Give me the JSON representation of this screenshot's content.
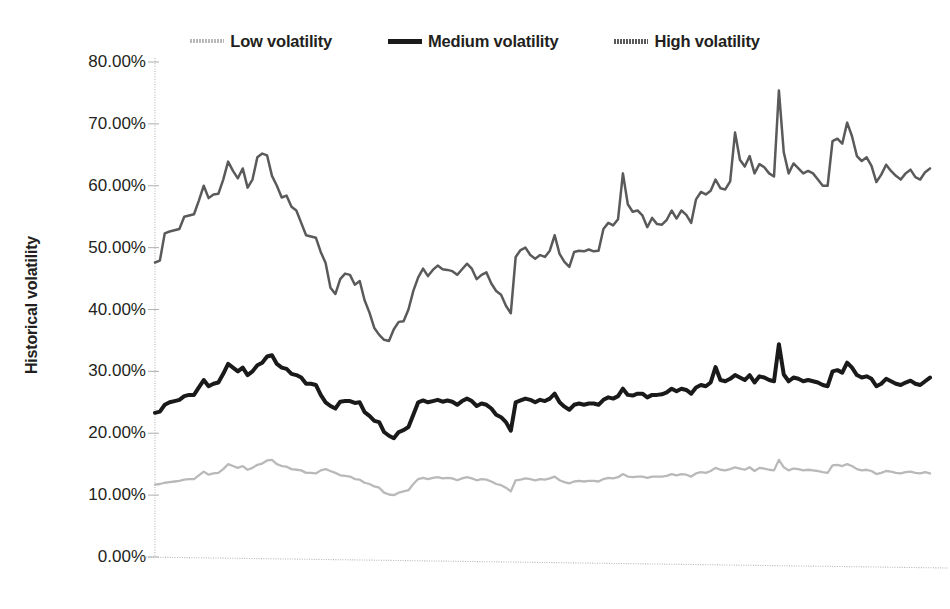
{
  "legend": {
    "position": "top-center",
    "entries": [
      {
        "label": "Low volatility",
        "icon": "line-swatch-dotted-light",
        "color": "#b9b9b9"
      },
      {
        "label": "Medium volatility",
        "icon": "line-swatch-solid-black",
        "color": "#1a1a1a"
      },
      {
        "label": "High volatility",
        "icon": "line-swatch-dotted-dark",
        "color": "#5a5a5a"
      }
    ]
  },
  "axes": {
    "y_title": "Historical volatility",
    "y_ticks": [
      "0.00%",
      "10.00%",
      "20.00%",
      "30.00%",
      "40.00%",
      "50.00%",
      "60.00%",
      "70.00%",
      "80.00%"
    ],
    "x_ticks": []
  },
  "colors": {
    "low": "#b9b9b9",
    "medium": "#1a1a1a",
    "high": "#5a5a5a",
    "axis": "#b5b5b5",
    "text": "#231f20",
    "background": "#ffffff"
  },
  "chart_data": {
    "type": "line",
    "title": "",
    "subtitle": "",
    "xlabel": "",
    "ylabel": "Historical volatility",
    "ylim": [
      0,
      80
    ],
    "ytick_step": 10,
    "y_unit": "percent",
    "grid": false,
    "x_axis_labels_shown": false,
    "legend_position": "top-center",
    "n_points": 160,
    "series": [
      {
        "name": "High volatility",
        "color": "#5a5a5a",
        "values": [
          47.6,
          47.9,
          52.3,
          52.6,
          52.8,
          53.0,
          55.0,
          55.2,
          55.4,
          57.6,
          60.0,
          58.0,
          58.6,
          58.7,
          61.0,
          63.9,
          62.4,
          61.2,
          62.8,
          59.7,
          61.0,
          64.6,
          65.2,
          64.9,
          61.6,
          60.0,
          58.1,
          58.4,
          56.6,
          56.0,
          54.0,
          52.0,
          51.8,
          51.6,
          49.3,
          47.5,
          43.5,
          42.5,
          44.9,
          45.8,
          45.6,
          44.0,
          44.6,
          41.5,
          39.5,
          37.0,
          35.9,
          35.1,
          34.9,
          36.8,
          38.0,
          38.1,
          40.0,
          43.0,
          45.2,
          46.6,
          45.4,
          46.4,
          47.1,
          46.5,
          46.4,
          46.2,
          45.6,
          46.5,
          47.4,
          46.6,
          44.9,
          45.6,
          46.0,
          44.2,
          43.0,
          42.4,
          40.6,
          39.4,
          48.5,
          49.6,
          50.0,
          48.8,
          48.2,
          48.8,
          48.5,
          49.5,
          52.0,
          49.0,
          47.7,
          46.9,
          49.3,
          49.5,
          49.4,
          49.7,
          49.4,
          49.5,
          53.0,
          54.0,
          53.6,
          54.6,
          62.0,
          57.0,
          55.8,
          56.0,
          55.2,
          53.3,
          54.8,
          53.8,
          53.7,
          54.5,
          56.0,
          54.7,
          56.0,
          55.3,
          54.0,
          57.8,
          59.0,
          58.6,
          59.2,
          61.0,
          59.6,
          59.4,
          60.7,
          68.6,
          64.2,
          63.1,
          64.8,
          62.0,
          63.5,
          63.0,
          62.0,
          61.5,
          75.4,
          65.4,
          62.0,
          63.6,
          62.8,
          62.0,
          62.4,
          62.0,
          61.0,
          60.0,
          60.0,
          67.2,
          67.6,
          66.8,
          70.2,
          68.0,
          64.8,
          64.0,
          64.6,
          63.2,
          60.6,
          61.8,
          63.4,
          62.4,
          61.6,
          61.0,
          62.0,
          62.6,
          61.4,
          61.0,
          62.2,
          62.8
        ]
      },
      {
        "name": "Medium volatility",
        "color": "#1a1a1a",
        "values": [
          23.3,
          23.5,
          24.6,
          25.0,
          25.2,
          25.4,
          26.0,
          26.2,
          26.2,
          27.4,
          28.6,
          27.6,
          28.0,
          28.2,
          29.6,
          31.2,
          30.6,
          30.0,
          30.6,
          29.4,
          30.0,
          31.0,
          31.4,
          32.4,
          32.6,
          31.2,
          30.6,
          30.4,
          29.6,
          29.4,
          29.0,
          28.0,
          28.0,
          27.8,
          26.2,
          25.0,
          24.4,
          24.0,
          25.1,
          25.2,
          25.2,
          24.9,
          25.0,
          23.4,
          22.8,
          22.0,
          21.8,
          20.2,
          19.6,
          19.2,
          20.2,
          20.5,
          21.0,
          23.0,
          25.0,
          25.3,
          25.0,
          25.2,
          25.4,
          25.1,
          25.3,
          25.1,
          24.6,
          25.2,
          25.6,
          25.2,
          24.4,
          24.8,
          24.6,
          24.0,
          23.0,
          22.6,
          21.8,
          20.4,
          25.0,
          25.3,
          25.6,
          25.4,
          25.0,
          25.4,
          25.2,
          25.6,
          26.4,
          25.0,
          24.3,
          23.8,
          24.6,
          24.8,
          24.6,
          24.8,
          24.8,
          24.6,
          25.4,
          25.8,
          25.6,
          26.0,
          27.2,
          26.2,
          26.1,
          26.4,
          26.4,
          25.8,
          26.2,
          26.2,
          26.3,
          26.6,
          27.2,
          26.8,
          27.2,
          27.0,
          26.4,
          27.4,
          27.8,
          27.6,
          28.2,
          30.7,
          28.6,
          28.4,
          28.8,
          29.4,
          29.0,
          28.6,
          29.4,
          28.2,
          29.2,
          29.0,
          28.6,
          28.4,
          34.4,
          29.5,
          28.4,
          29.0,
          28.8,
          28.4,
          28.6,
          28.4,
          28.2,
          27.8,
          27.6,
          30.0,
          30.2,
          29.8,
          31.4,
          30.6,
          29.4,
          29.0,
          29.2,
          28.8,
          27.6,
          28.0,
          28.8,
          28.4,
          28.0,
          27.8,
          28.2,
          28.5,
          28.0,
          27.8,
          28.4,
          29.0
        ]
      },
      {
        "name": "Low volatility",
        "color": "#b9b9b9",
        "values": [
          11.7,
          11.8,
          12.0,
          12.1,
          12.2,
          12.3,
          12.5,
          12.6,
          12.6,
          13.2,
          13.8,
          13.3,
          13.5,
          13.6,
          14.2,
          15.0,
          14.7,
          14.4,
          14.7,
          14.1,
          14.4,
          14.9,
          15.1,
          15.6,
          15.7,
          15.0,
          14.7,
          14.6,
          14.2,
          14.1,
          14.0,
          13.6,
          13.6,
          13.5,
          14.0,
          14.2,
          13.9,
          13.6,
          13.2,
          13.1,
          13.0,
          12.6,
          12.5,
          12.0,
          11.8,
          11.4,
          11.2,
          10.4,
          10.1,
          10.0,
          10.4,
          10.6,
          10.8,
          11.8,
          12.6,
          12.8,
          12.6,
          12.8,
          12.9,
          12.7,
          12.8,
          12.7,
          12.4,
          12.7,
          12.9,
          12.7,
          12.4,
          12.6,
          12.5,
          12.2,
          11.8,
          11.6,
          11.2,
          10.6,
          12.4,
          12.5,
          12.7,
          12.6,
          12.4,
          12.6,
          12.5,
          12.7,
          13.0,
          12.4,
          12.1,
          11.9,
          12.2,
          12.3,
          12.2,
          12.3,
          12.3,
          12.2,
          12.6,
          12.8,
          12.7,
          12.9,
          13.4,
          13.0,
          12.9,
          13.0,
          13.0,
          12.8,
          13.0,
          13.0,
          13.0,
          13.1,
          13.4,
          13.2,
          13.4,
          13.3,
          13.0,
          13.5,
          13.7,
          13.6,
          13.9,
          14.4,
          14.1,
          14.0,
          14.2,
          14.5,
          14.3,
          14.1,
          14.5,
          13.9,
          14.4,
          14.3,
          14.1,
          14.0,
          15.7,
          14.5,
          14.0,
          14.3,
          14.2,
          14.0,
          14.1,
          14.0,
          13.9,
          13.7,
          13.6,
          14.8,
          14.9,
          14.7,
          15.0,
          14.7,
          14.2,
          14.0,
          14.1,
          13.9,
          13.4,
          13.6,
          13.9,
          13.8,
          13.6,
          13.5,
          13.7,
          13.8,
          13.6,
          13.5,
          13.7,
          13.5
        ]
      }
    ]
  }
}
